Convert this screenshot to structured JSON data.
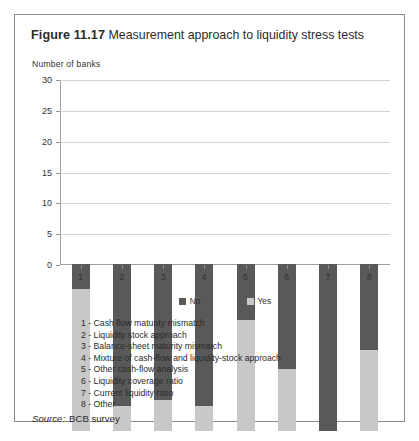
{
  "figure": {
    "label": "Figure 11.17",
    "title": "Measurement approach to liquidity stress tests",
    "axis_caption": "Number of banks",
    "source_label": "Source:",
    "source_value": "BCB survey"
  },
  "legend": {
    "items": [
      {
        "label": "No",
        "color": "#595959"
      },
      {
        "label": "Yes",
        "color": "#c8c8c8"
      }
    ]
  },
  "key": {
    "items": [
      "1 - Cash flow maturity mismatch",
      "2 - Liquidity stock approach",
      "3 - Balance-sheet maturity mismatch",
      "4 - Mixture of cash-flow and liquidity-stock approach",
      "5 - Other cash-flow analysis",
      "6 - Liquidity coverage ratio",
      "7 - Current liquidity ratio",
      "8 - Other"
    ]
  },
  "chart_data": {
    "type": "bar",
    "stacked": true,
    "title": "Measurement approach to liquidity stress tests",
    "xlabel": "",
    "ylabel": "Number of banks",
    "ylim": [
      0,
      30
    ],
    "yticks": [
      0,
      5,
      10,
      15,
      20,
      25,
      30
    ],
    "grid": true,
    "legend_position": "bottom",
    "categories": [
      "1",
      "2",
      "3",
      "4",
      "5",
      "6",
      "7",
      "8"
    ],
    "category_names": [
      "Cash flow maturity mismatch",
      "Liquidity stock approach",
      "Balance-sheet maturity mismatch",
      "Mixture of cash-flow and liquidity-stock approach",
      "Other cash-flow analysis",
      "Liquidity coverage ratio",
      "Current liquidity ratio",
      "Other"
    ],
    "series": [
      {
        "name": "Yes",
        "color": "#c8c8c8",
        "values": [
          23,
          4,
          5,
          4,
          18,
          10,
          0,
          13
        ]
      },
      {
        "name": "No",
        "color": "#595959",
        "values": [
          4,
          23,
          22,
          23,
          9,
          17,
          27,
          14
        ]
      }
    ],
    "totals": [
      27,
      27,
      27,
      27,
      27,
      27,
      27,
      27
    ]
  }
}
